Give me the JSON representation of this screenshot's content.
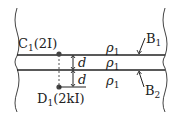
{
  "diagram": {
    "point_c": {
      "name": "C",
      "sub": "1",
      "value": "(2I)"
    },
    "point_d": {
      "name": "D",
      "sub": "1",
      "value": "(2kI)"
    },
    "boundary_top": {
      "name": "B",
      "sub": "1"
    },
    "boundary_bottom": {
      "name": "B",
      "sub": "2"
    },
    "regions": [
      {
        "rho": "ρ",
        "sub": "1"
      },
      {
        "rho": "ρ",
        "sub": "1"
      },
      {
        "rho": "ρ",
        "sub": "1"
      }
    ],
    "distances": [
      "d",
      "d"
    ]
  }
}
